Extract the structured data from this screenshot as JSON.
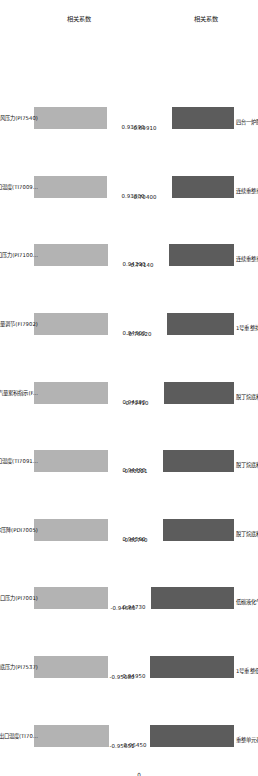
{
  "chart_data": [
    {
      "type": "bar",
      "title": "",
      "ylabel": "相关系数",
      "xlabel": "",
      "orientation": "vertical",
      "bar_color": "#5c5c5c",
      "ylim": [
        -1.0,
        0.0
      ],
      "grid": false,
      "legend": "none",
      "categories": [
        "四台一炉膛压力(PI7035B)",
        "连续重整重整进料C7烷烃质量分数",
        "连续重整重整进料C6烷烃质量分数",
        "1号重整排火炬干气",
        "脱丁烷底料C5烷烃质量分数",
        "脱丁烷底料C6烷烃质量分数",
        "脱丁烷底料C7烷烃质量分数",
        "低碳液化气收率",
        "1号重整低碳液化气",
        "重整单元存差"
      ],
      "values": [
        -0.6991,
        -0.704,
        -0.7414,
        -0.7602,
        -0.7941,
        -0.80221,
        -0.8074,
        -0.9466,
        -0.9508,
        -0.95651
      ],
      "value_labels": [
        "-0.69910",
        "-0.70400",
        "-0.74140",
        "-0.76020",
        "-0.79410",
        "-0.80221",
        "-0.80740",
        "-0.94660",
        "-0.95080",
        "-0.95651"
      ],
      "axis_tick_labels": [
        "0"
      ]
    },
    {
      "type": "bar",
      "title": "",
      "ylabel": "相关系数",
      "xlabel": "",
      "orientation": "vertical",
      "bar_color": "#b3b3b3",
      "ylim": [
        0.0,
        1.0
      ],
      "grid": false,
      "legend": "none",
      "categories": [
        "V757一次提升风压力(PI7540)",
        "R701第一反应器出口温度(TI7009...",
        "R704第四反应器入口压力(PI7100...",
        "中压给水流量调节(FI7902)",
        "0.3MPa蒸汽炉自产蒸汽量累积指示(F...",
        "C701离心机组汽轮机入口温度(TI7091...",
        "E701进料蒸汽(体压降(PDI7005)",
        "罐E701入口压力(PI7001)",
        "阿德斗外+阿德底压力(PI7537)",
        "换热器E701反应产物出口温度(TI70..."
      ],
      "values": [
        0.9369,
        0.938,
        0.9429,
        0.943,
        0.9439,
        0.9449,
        0.9459,
        0.9473,
        0.9495,
        0.9645
      ],
      "value_labels": [
        "0.93690",
        "0.93800",
        "0.94290",
        "0.94300",
        "0.94390",
        "0.94490",
        "0.94590",
        "0.94730",
        "0.94950",
        "0.96450"
      ],
      "axis_tick_labels": []
    }
  ]
}
